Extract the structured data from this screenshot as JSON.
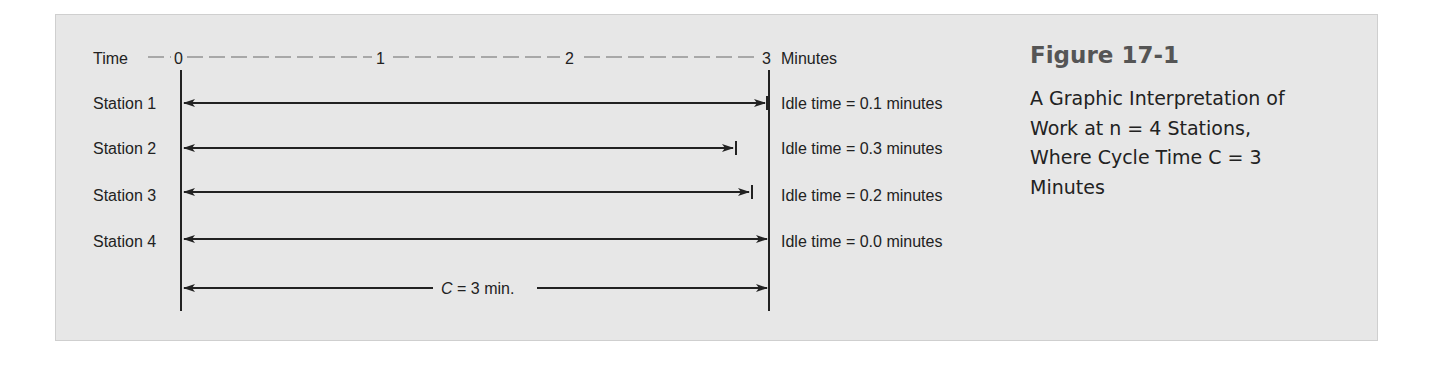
{
  "figure": {
    "title": "Figure 17-1",
    "caption_lines": [
      "A Graphic Interpretation of",
      "Work at n = 4 Stations,",
      "Where Cycle Time C = 3",
      "Minutes"
    ]
  },
  "axis": {
    "label": "Time",
    "unit": "Minutes",
    "ticks": [
      "0",
      "1",
      "2",
      "3"
    ]
  },
  "stations": [
    {
      "label": "Station 1",
      "work_minutes": 2.9,
      "idle": "Idle time = 0.1 minutes"
    },
    {
      "label": "Station 2",
      "work_minutes": 2.7,
      "idle": "Idle time = 0.3 minutes"
    },
    {
      "label": "Station 3",
      "work_minutes": 2.8,
      "idle": "Idle time = 0.2 minutes"
    },
    {
      "label": "Station 4",
      "work_minutes": 3.0,
      "idle": "Idle time = 0.0 minutes"
    }
  ],
  "cycle": {
    "label_var": "C",
    "label_rest": " = 3 min."
  },
  "colors": {
    "panel_bg": "#e7e7e7",
    "line": "#222222",
    "dash": "#a8a8a8",
    "title": "#555555"
  }
}
